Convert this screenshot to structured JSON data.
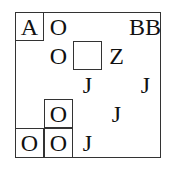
{
  "puzzle": {
    "rows": 5,
    "cols": 5,
    "cells": [
      {
        "row": 0,
        "col": 0,
        "text": "A",
        "boxed": true
      },
      {
        "row": 0,
        "col": 1,
        "text": "O",
        "boxed": false
      },
      {
        "row": 0,
        "col": 4,
        "text": "BB",
        "boxed": false
      },
      {
        "row": 1,
        "col": 1,
        "text": "O",
        "boxed": false
      },
      {
        "row": 1,
        "col": 2,
        "text": "",
        "boxed": true
      },
      {
        "row": 1,
        "col": 3,
        "text": "Z",
        "boxed": false
      },
      {
        "row": 2,
        "col": 2,
        "text": "J",
        "boxed": false
      },
      {
        "row": 2,
        "col": 4,
        "text": "J",
        "boxed": false
      },
      {
        "row": 3,
        "col": 1,
        "text": "O",
        "boxed": true
      },
      {
        "row": 3,
        "col": 3,
        "text": "J",
        "boxed": false
      },
      {
        "row": 4,
        "col": 0,
        "text": "O",
        "boxed": true
      },
      {
        "row": 4,
        "col": 1,
        "text": "O",
        "boxed": true
      },
      {
        "row": 4,
        "col": 2,
        "text": "J",
        "boxed": false
      }
    ]
  }
}
